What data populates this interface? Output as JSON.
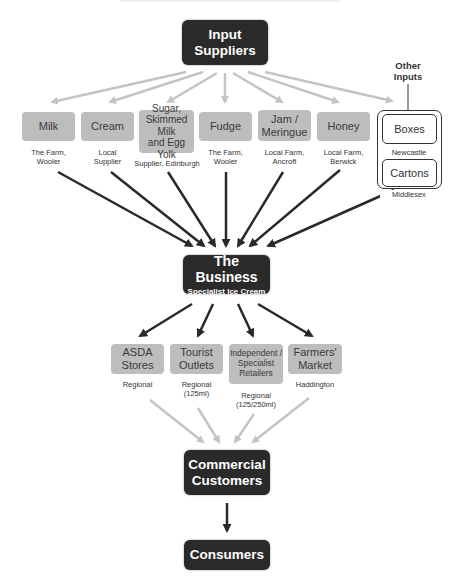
{
  "diagram": {
    "input_suppliers": [
      "Input",
      "Suppliers"
    ],
    "other_inputs": [
      "Other",
      "Inputs"
    ],
    "suppliers": [
      {
        "name": "Milk",
        "lines": [
          "Milk"
        ],
        "location": [
          "The Farm,",
          "Wooler"
        ]
      },
      {
        "name": "Cream",
        "lines": [
          "Cream"
        ],
        "location": [
          "Local",
          "Supplier"
        ]
      },
      {
        "name": "Sugar",
        "lines": [
          "Sugar,",
          "Skimmed Milk",
          "and Egg Yolk"
        ],
        "location": [
          "Supplier, Edinburgh"
        ]
      },
      {
        "name": "Fudge",
        "lines": [
          "Fudge"
        ],
        "location": [
          "The Farm,",
          "Wooler"
        ]
      },
      {
        "name": "Jam",
        "lines": [
          "Jam /",
          "Meringue"
        ],
        "location": [
          "Local Farm,",
          "Ancroft"
        ]
      },
      {
        "name": "Honey",
        "lines": [
          "Honey"
        ],
        "location": [
          "Local Farm,",
          "Berwick"
        ]
      }
    ],
    "packaging": [
      {
        "name": "Boxes",
        "location": "Newcastle"
      },
      {
        "name": "Cartons",
        "location": "Middlesex"
      }
    ],
    "business": {
      "title": "The Business",
      "subtitle": "Specialist Ice Cream"
    },
    "channels": [
      {
        "lines": [
          "ASDA",
          "Stores"
        ],
        "detail": [
          "Regional"
        ]
      },
      {
        "lines": [
          "Tourist",
          "Outlets"
        ],
        "detail": [
          "Regional",
          "(125ml)"
        ]
      },
      {
        "lines": [
          "Independent /",
          "Specialist",
          "Retailers"
        ],
        "detail": [
          "Regional",
          "(125/250ml)"
        ]
      },
      {
        "lines": [
          "Farmers'",
          "Market"
        ],
        "detail": [
          "Haddington"
        ]
      }
    ],
    "commercial": [
      "Commercial",
      "Customers"
    ],
    "consumers": "Consumers"
  }
}
